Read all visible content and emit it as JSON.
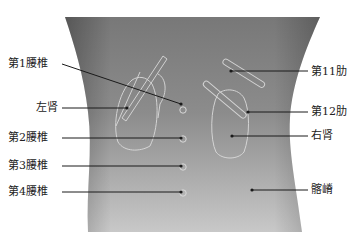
{
  "diagram": {
    "type": "anatomical-back-surface-landmarks",
    "body": {
      "fill_top": "#7a7a7a",
      "fill_bottom": "#c4c4c4",
      "outline_color": "#e6e6e6"
    },
    "left_labels": [
      {
        "text": "第1腰椎",
        "x": 8,
        "y": 58,
        "line": [
          62,
          64,
          181,
          104
        ]
      },
      {
        "text": "左肾",
        "x": 36,
        "y": 102,
        "line": [
          62,
          108,
          127,
          108
        ]
      },
      {
        "text": "第2腰椎",
        "x": 8,
        "y": 132,
        "line": [
          62,
          138,
          181,
          138
        ]
      },
      {
        "text": "第3腰椎",
        "x": 8,
        "y": 160,
        "line": [
          62,
          166,
          181,
          166
        ]
      },
      {
        "text": "第4腰椎",
        "x": 8,
        "y": 186,
        "line": [
          62,
          192,
          181,
          192
        ]
      }
    ],
    "right_labels": [
      {
        "text": "第11肋",
        "x": 311,
        "y": 66,
        "line": [
          231,
          71,
          308,
          71
        ]
      },
      {
        "text": "第12肋",
        "x": 311,
        "y": 106,
        "line": [
          248,
          112,
          308,
          112
        ]
      },
      {
        "text": "右肾",
        "x": 311,
        "y": 130,
        "line": [
          232,
          136,
          308,
          136
        ]
      },
      {
        "text": "髂嵴",
        "x": 311,
        "y": 184,
        "line": [
          252,
          190,
          308,
          190
        ]
      }
    ],
    "spine_markers": [
      {
        "name": "L1",
        "cx": 183,
        "cy": 110
      },
      {
        "name": "L2",
        "cx": 183,
        "cy": 139
      },
      {
        "name": "L3",
        "cx": 183,
        "cy": 167
      },
      {
        "name": "L4",
        "cx": 183,
        "cy": 193
      }
    ],
    "line_color": "#1a1a1a",
    "text_color": "#222222"
  }
}
